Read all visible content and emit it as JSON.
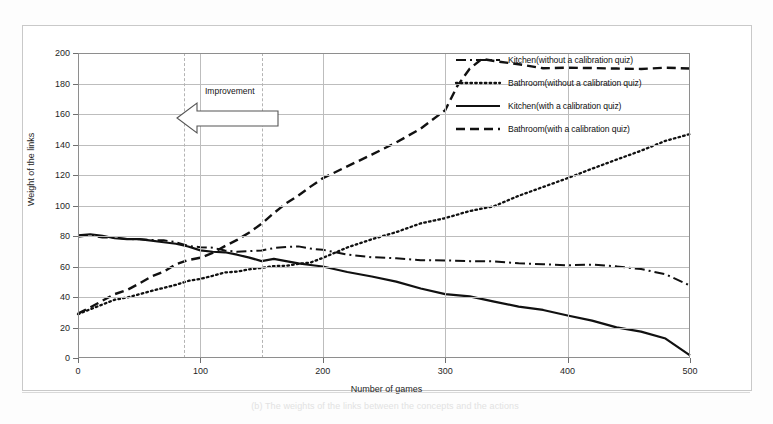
{
  "figure": {
    "caption": "(b)  The weights of the links between the concepts and the actions",
    "improvement_label": "Improvement"
  },
  "chart_data": {
    "type": "line",
    "title": "",
    "xlabel": "Number of games",
    "ylabel": "Weight of the links",
    "xlim": [
      0,
      500
    ],
    "ylim": [
      0,
      200
    ],
    "xticks": [
      0,
      100,
      200,
      300,
      400,
      500
    ],
    "yticks": [
      0,
      20,
      40,
      60,
      80,
      100,
      120,
      140,
      160,
      180,
      200
    ],
    "grid": true,
    "legend_position": "upper right",
    "extra_vertical_markers": [
      87,
      150
    ],
    "series": [
      {
        "name": "Kitchen(without a calibration quiz)",
        "style": "dash-dot",
        "color": "#111111",
        "x": [
          0,
          10,
          20,
          30,
          40,
          50,
          60,
          70,
          80,
          90,
          100,
          110,
          120,
          130,
          140,
          150,
          160,
          170,
          180,
          190,
          200,
          220,
          240,
          260,
          280,
          300,
          320,
          340,
          360,
          380,
          400,
          420,
          440,
          460,
          480,
          500
        ],
        "values": [
          80,
          80,
          79,
          79,
          78,
          78,
          77,
          77,
          76,
          74,
          73,
          72,
          71,
          70,
          70,
          71,
          72,
          73,
          73,
          72,
          71,
          68,
          66,
          65,
          64,
          64,
          63,
          63,
          62,
          62,
          61,
          61,
          60,
          58,
          55,
          48
        ]
      },
      {
        "name": "Bathroom(without a calibration quiz)",
        "style": "dotted",
        "color": "#111111",
        "x": [
          0,
          10,
          20,
          30,
          40,
          50,
          60,
          70,
          80,
          90,
          100,
          110,
          120,
          130,
          140,
          150,
          160,
          170,
          180,
          190,
          200,
          220,
          240,
          260,
          280,
          300,
          320,
          340,
          360,
          380,
          400,
          420,
          440,
          460,
          480,
          500
        ],
        "values": [
          29,
          32,
          35,
          38,
          40,
          42,
          44,
          46,
          48,
          50,
          52,
          54,
          56,
          57,
          58,
          59,
          60,
          61,
          62,
          63,
          66,
          72,
          78,
          83,
          88,
          92,
          96,
          100,
          106,
          112,
          118,
          124,
          130,
          136,
          142,
          147
        ]
      },
      {
        "name": "Kitchen(with a calibration quiz)",
        "style": "solid",
        "color": "#111111",
        "x": [
          0,
          10,
          20,
          30,
          40,
          50,
          60,
          70,
          80,
          90,
          100,
          110,
          120,
          130,
          140,
          150,
          160,
          170,
          180,
          190,
          200,
          220,
          240,
          260,
          280,
          300,
          320,
          340,
          360,
          380,
          400,
          420,
          440,
          460,
          480,
          500
        ],
        "values": [
          80,
          81,
          80,
          79,
          78,
          78,
          77,
          76,
          75,
          73,
          71,
          70,
          69,
          68,
          66,
          64,
          65,
          64,
          62,
          61,
          60,
          56,
          53,
          50,
          46,
          42,
          40,
          37,
          34,
          31,
          28,
          24,
          20,
          17,
          13,
          2
        ]
      },
      {
        "name": "Bathroom(with a calibration quiz)",
        "style": "dashed",
        "color": "#111111",
        "x": [
          0,
          10,
          20,
          30,
          40,
          50,
          60,
          70,
          80,
          90,
          100,
          110,
          120,
          130,
          140,
          150,
          160,
          170,
          180,
          190,
          200,
          220,
          240,
          260,
          280,
          300,
          310,
          320,
          330,
          340,
          360,
          380,
          400,
          420,
          440,
          460,
          480,
          500
        ],
        "values": [
          29,
          33,
          38,
          42,
          45,
          49,
          53,
          57,
          61,
          64,
          66,
          69,
          73,
          77,
          82,
          88,
          95,
          101,
          106,
          112,
          118,
          126,
          133,
          141,
          150,
          163,
          178,
          190,
          196,
          195,
          193,
          190,
          190,
          190,
          190,
          190,
          190,
          190
        ]
      }
    ]
  }
}
